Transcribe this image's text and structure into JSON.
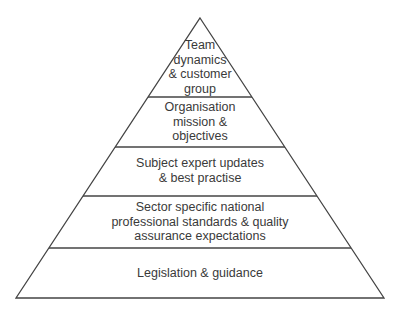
{
  "diagram": {
    "type": "pyramid",
    "colors": {
      "line": "#444444",
      "text": "#3a3a3a",
      "fill": "#ffffff"
    },
    "tiers": [
      {
        "level": 1,
        "label": "Team\ndynamics\n& customer\ngroup"
      },
      {
        "level": 2,
        "label": "Organisation\nmission &\nobjectives"
      },
      {
        "level": 3,
        "label": "Subject expert updates\n& best practise"
      },
      {
        "level": 4,
        "label": "Sector specific national\nprofessional standards & quality\nassurance expectations"
      },
      {
        "level": 5,
        "label": "Legislation & guidance"
      }
    ]
  }
}
